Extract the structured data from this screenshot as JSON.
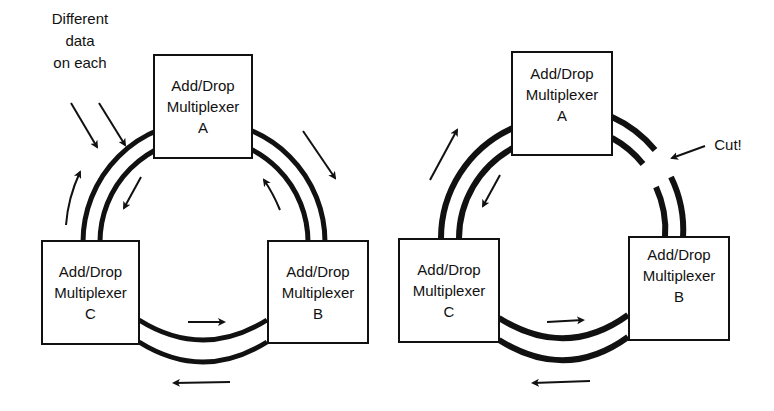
{
  "left_diagram": {
    "annotation": [
      "Different",
      "data",
      "on each"
    ],
    "nodes": [
      {
        "id": "A",
        "line1": "Add/Drop",
        "line2": "Multiplexer",
        "line3": "A"
      },
      {
        "id": "B",
        "line1": "Add/Drop",
        "line2": "Multiplexer",
        "line3": "B"
      },
      {
        "id": "C",
        "line1": "Add/Drop",
        "line2": "Multiplexer",
        "line3": "C"
      }
    ]
  },
  "right_diagram": {
    "annotation": "Cut!",
    "nodes": [
      {
        "id": "A",
        "line1": "Add/Drop",
        "line2": "Multiplexer",
        "line3": "A"
      },
      {
        "id": "B",
        "line1": "Add/Drop",
        "line2": "Multiplexer",
        "line3": "B"
      },
      {
        "id": "C",
        "line1": "Add/Drop",
        "line2": "Multiplexer",
        "line3": "C"
      }
    ]
  }
}
